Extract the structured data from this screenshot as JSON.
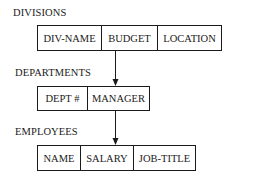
{
  "diagram": {
    "type": "hierarchical-record-structure",
    "records": [
      {
        "name": "DIVISIONS",
        "fields": [
          "DIV-NAME",
          "BUDGET",
          "LOCATION"
        ]
      },
      {
        "name": "DEPARTMENTS",
        "fields": [
          "DEPT #",
          "MANAGER"
        ]
      },
      {
        "name": "EMPLOYEES",
        "fields": [
          "NAME",
          "SALARY",
          "JOB-TITLE"
        ]
      }
    ],
    "links": [
      {
        "from": "DIVISIONS",
        "to": "DEPARTMENTS",
        "style": "arrow"
      },
      {
        "from": "DEPARTMENTS",
        "to": "EMPLOYEES",
        "style": "arrow"
      }
    ]
  }
}
